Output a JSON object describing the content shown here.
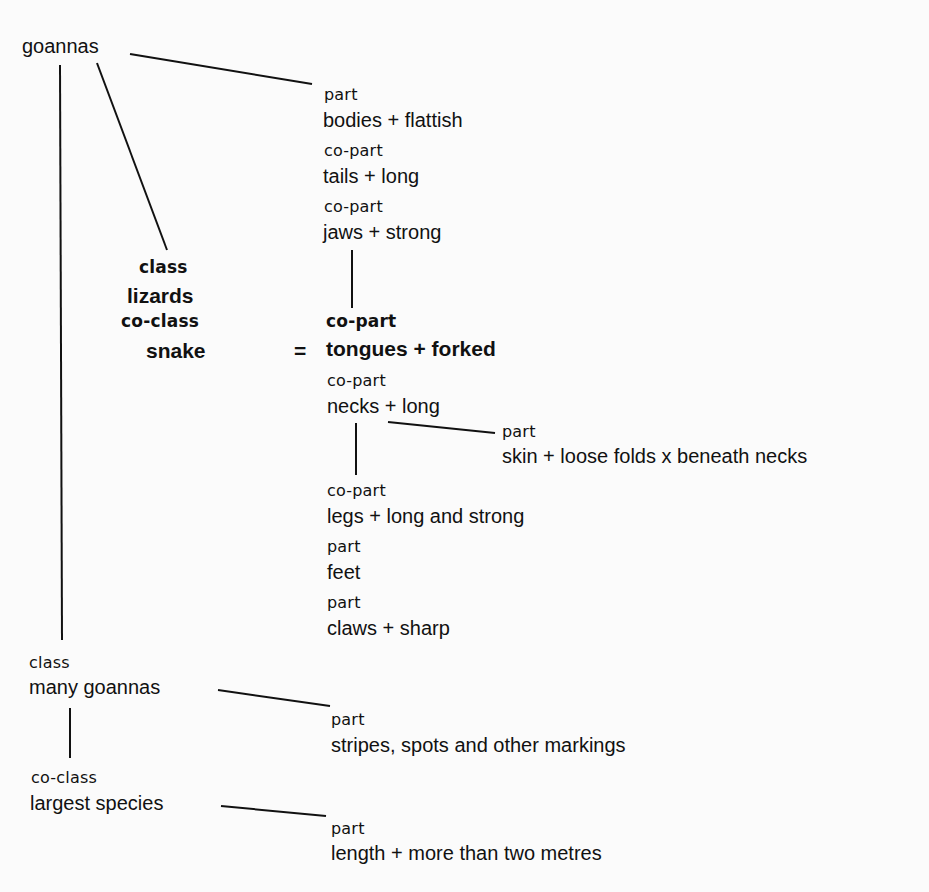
{
  "diagram": {
    "root": "goannas",
    "parts_top": [
      {
        "relation": "part",
        "text": "bodies + flattish"
      },
      {
        "relation": "co-part",
        "text": "tails + long"
      },
      {
        "relation": "co-part",
        "text": "jaws + strong"
      }
    ],
    "class_block": {
      "class_label": "class",
      "class_value": "lizards",
      "coclass_label": "co-class",
      "coclass_value": "snake",
      "equals": "="
    },
    "parts_middle": [
      {
        "relation": "co-part",
        "text": "tongues + forked"
      },
      {
        "relation": "co-part",
        "text": "necks + long"
      }
    ],
    "neck_part": {
      "relation": "part",
      "text": "skin + loose folds x beneath necks"
    },
    "parts_bottom": [
      {
        "relation": "co-part",
        "text": "legs + long and strong"
      },
      {
        "relation": "part",
        "text": "feet"
      },
      {
        "relation": "part",
        "text": "claws + sharp"
      }
    ],
    "subclasses": [
      {
        "relation": "class",
        "text": "many goannas",
        "part_relation": "part",
        "part_text": "stripes, spots and other markings"
      },
      {
        "relation": "co-class",
        "text": "largest species",
        "part_relation": "part",
        "part_text": "length + more than two metres"
      }
    ]
  }
}
